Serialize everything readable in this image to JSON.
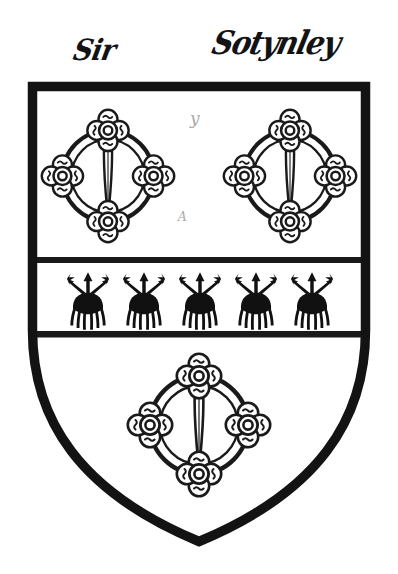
{
  "plate": {
    "title": "Heraldic Shield Plate",
    "background_color": "#ffffff",
    "ink_color": "#1a1a1a",
    "field_color": "#ffffff",
    "width": 398,
    "height": 574
  },
  "inscriptions": {
    "left": "Sir",
    "right": "Sotynley"
  },
  "annotations": {
    "mark_upper": "y",
    "mark_lower": "A"
  },
  "shield": {
    "outline_name": "heater-shield",
    "border_width": 9,
    "top_y": 82,
    "left_x": 28,
    "right_x": 372,
    "point_y": 545
  },
  "fess": {
    "label": "fess",
    "top_y": 257,
    "bottom_y": 337,
    "border_width": 6,
    "charge_name": "ermine-spot",
    "charge_count": 5,
    "charge_positions_x": [
      88,
      144,
      200,
      256,
      312
    ]
  },
  "charges": {
    "name": "annulet-with-quatrefoils-and-spear",
    "count": 3,
    "chief": [
      {
        "cx": 108,
        "cy": 176,
        "r": 62
      },
      {
        "cx": 290,
        "cy": 176,
        "r": 62
      }
    ],
    "base": [
      {
        "cx": 199,
        "cy": 425,
        "r": 66
      }
    ],
    "quatrefoil_count_per_charge": 4,
    "quatrefoil_positions": [
      "top",
      "right",
      "bottom",
      "left"
    ]
  }
}
